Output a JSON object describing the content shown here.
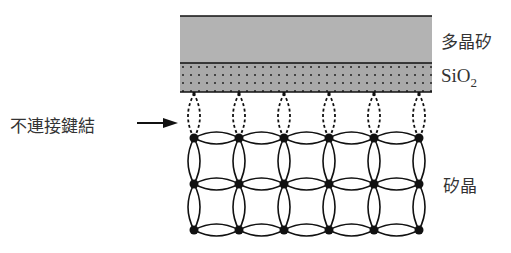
{
  "labels": {
    "polysilicon": "多晶矽",
    "sio2_main": "SiO",
    "sio2_sub": "2",
    "dangling_bonds": "不連接鍵結",
    "silicon_crystal": "矽晶"
  },
  "layers": {
    "polysilicon": {
      "x": 180,
      "y": 16,
      "width": 252,
      "height": 47,
      "fill": "#b3b3b3"
    },
    "sio2": {
      "x": 180,
      "y": 63,
      "width": 252,
      "height": 29,
      "fill": "#a8a8a8"
    }
  },
  "lattice": {
    "columns_x": [
      194,
      239,
      284,
      329,
      374,
      419
    ],
    "rows_y": [
      138,
      184,
      230
    ],
    "node_color": "#111111"
  },
  "colors": {
    "line": "#111111",
    "text": "#333333"
  }
}
